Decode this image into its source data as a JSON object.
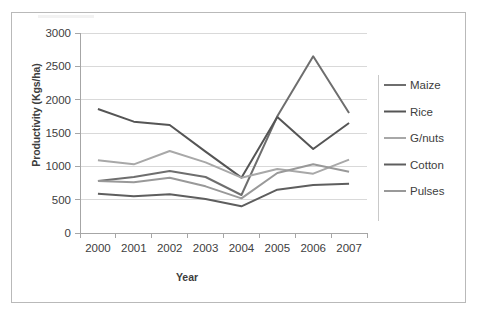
{
  "figure": {
    "border_color": "#b9b9b9",
    "background": "#ffffff"
  },
  "axis_titles": {
    "y": "Productivity (Kgs/ha)",
    "x": "Year"
  },
  "chart_data": {
    "type": "line",
    "title": "",
    "subtitle": "",
    "xlabel": "Year",
    "ylabel": "Productivity (Kgs/ha)",
    "categories": [
      "2000",
      "2001",
      "2002",
      "2003",
      "2004",
      "2005",
      "2006",
      "2007"
    ],
    "x": [
      2000,
      2001,
      2002,
      2003,
      2004,
      2005,
      2006,
      2007
    ],
    "ylim": [
      0,
      3000
    ],
    "yticks": [
      0,
      500,
      1000,
      1500,
      2000,
      2500,
      3000
    ],
    "ytick_labels": [
      "0",
      "500",
      "1000",
      "1500",
      "2000",
      "2500",
      "3000"
    ],
    "grid": "horizontal",
    "legend_position": "right",
    "series": [
      {
        "name": "Maize",
        "color": "#6e6e6e",
        "values": [
          780,
          840,
          930,
          840,
          570,
          1750,
          2650,
          1800
        ]
      },
      {
        "name": "Rice",
        "color": "#555555",
        "values": [
          1860,
          1670,
          1620,
          1220,
          830,
          1740,
          1260,
          1650
        ]
      },
      {
        "name": "G/nuts",
        "color": "#a8a8a8",
        "values": [
          1090,
          1030,
          1230,
          1060,
          830,
          960,
          890,
          1100
        ]
      },
      {
        "name": "Cotton",
        "color": "#5e5e5e",
        "values": [
          590,
          550,
          580,
          510,
          400,
          650,
          720,
          740
        ]
      },
      {
        "name": "Pulses",
        "color": "#999999",
        "values": [
          780,
          760,
          830,
          700,
          520,
          900,
          1030,
          920
        ]
      }
    ]
  },
  "legend": {
    "entries": [
      {
        "label": "Maize"
      },
      {
        "label": "Rice"
      },
      {
        "label": "G/nuts"
      },
      {
        "label": "Cotton"
      },
      {
        "label": "Pulses"
      }
    ]
  }
}
